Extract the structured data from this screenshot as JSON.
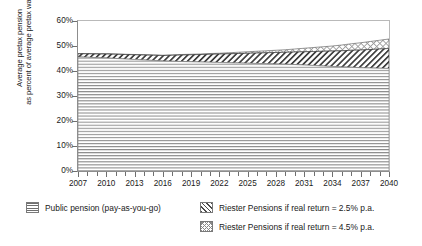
{
  "chart_data": {
    "type": "area",
    "stacked": true,
    "title": "",
    "xlabel": "",
    "ylabel": "Average pretax pension as percent of average pretax wage",
    "ylabel_lines": [
      "Average pretax pension",
      "as percent of average pretax wage"
    ],
    "ylim": [
      0,
      60
    ],
    "ytick_labels": [
      "0%",
      "10%",
      "20%",
      "30%",
      "40%",
      "50%",
      "60%"
    ],
    "ytick_values": [
      0,
      10,
      20,
      30,
      40,
      50,
      60
    ],
    "xlim": [
      2007,
      2040
    ],
    "xtick_labels": [
      "2007",
      "2010",
      "2013",
      "2016",
      "2019",
      "2022",
      "2025",
      "2028",
      "2031",
      "2034",
      "2037",
      "2040"
    ],
    "xtick_values": [
      2007,
      2010,
      2013,
      2016,
      2019,
      2022,
      2025,
      2028,
      2031,
      2034,
      2037,
      2040
    ],
    "x": [
      2007,
      2008,
      2009,
      2010,
      2011,
      2012,
      2013,
      2014,
      2015,
      2016,
      2017,
      2018,
      2019,
      2020,
      2021,
      2022,
      2023,
      2024,
      2025,
      2026,
      2027,
      2028,
      2029,
      2030,
      2031,
      2032,
      2033,
      2034,
      2035,
      2036,
      2037,
      2038,
      2039,
      2040
    ],
    "grid": false,
    "legend_position": "below",
    "series": [
      {
        "name": "Public pension (pay-as-you-go)",
        "pattern": "horizontal-lines",
        "values": [
          45.6,
          45.5,
          45.3,
          45.2,
          45.0,
          44.8,
          44.6,
          44.4,
          44.2,
          44.0,
          43.9,
          43.8,
          43.7,
          43.6,
          43.5,
          43.4,
          43.3,
          43.2,
          43.1,
          43.0,
          42.9,
          42.8,
          42.7,
          42.6,
          42.4,
          42.2,
          42.0,
          41.8,
          41.6,
          41.5,
          41.3,
          41.2,
          41.1,
          41.0
        ]
      },
      {
        "name": "Riester Pensions if real return = 2.5% p.a.",
        "pattern": "diagonal-hatch",
        "values": [
          1.3,
          1.4,
          1.5,
          1.6,
          1.7,
          1.8,
          1.9,
          2.0,
          2.1,
          2.2,
          2.4,
          2.6,
          2.8,
          3.0,
          3.2,
          3.4,
          3.6,
          3.8,
          4.0,
          4.2,
          4.4,
          4.6,
          4.8,
          5.0,
          5.3,
          5.6,
          5.9,
          6.2,
          6.5,
          6.8,
          7.1,
          7.4,
          7.7,
          8.0
        ]
      },
      {
        "name": "Riester Pensions if real return = 4.5% p.a.",
        "pattern": "cross-hatch",
        "values": [
          0.1,
          0.1,
          0.1,
          0.1,
          0.1,
          0.1,
          0.1,
          0.1,
          0.1,
          0.1,
          0.1,
          0.2,
          0.2,
          0.2,
          0.3,
          0.3,
          0.4,
          0.5,
          0.6,
          0.7,
          0.8,
          0.9,
          1.0,
          1.2,
          1.4,
          1.6,
          1.8,
          2.0,
          2.3,
          2.6,
          2.9,
          3.2,
          3.5,
          3.8
        ]
      }
    ],
    "annotations": []
  },
  "legend": {
    "left_column": [
      {
        "label": "Public pension (pay-as-you-go)",
        "pattern": "horizontal-lines"
      }
    ],
    "right_column": [
      {
        "label": "Riester Pensions if real return = 2.5% p.a.",
        "pattern": "diagonal-hatch"
      },
      {
        "label": "Riester Pensions if real return = 4.5% p.a.",
        "pattern": "cross-hatch"
      }
    ]
  },
  "colors": {
    "axis": "#8d8d8d",
    "frame_light": "#b9b9b9",
    "text": "#1a1a1a",
    "series_public": "#6e6e6e",
    "series_riester25": "#4a4a4a",
    "series_riester45": "#8a8a8a",
    "background": "#ffffff"
  }
}
